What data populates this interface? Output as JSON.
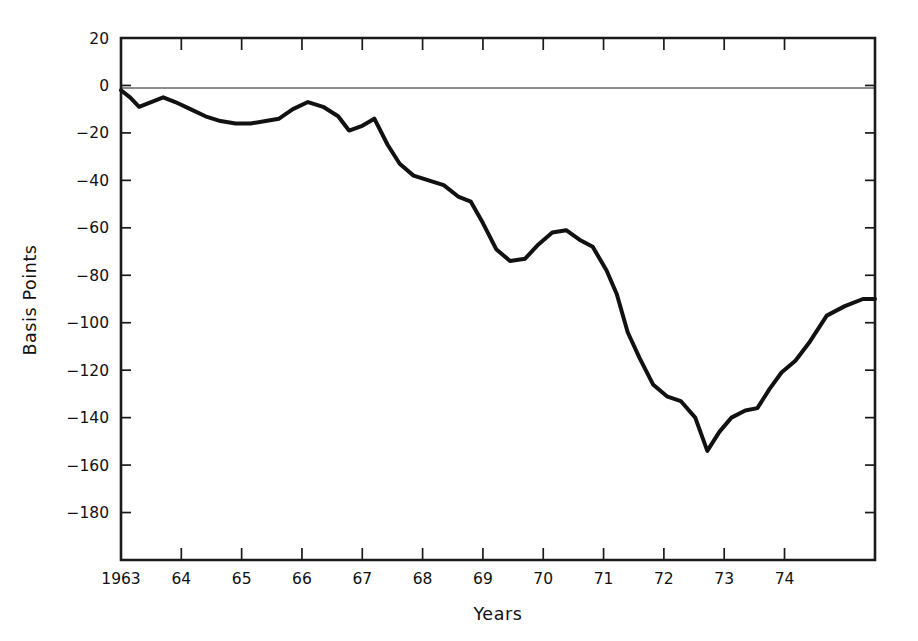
{
  "chart_data": {
    "type": "line",
    "title": "",
    "xlabel": "Years",
    "ylabel": "Basis Points",
    "xlim": [
      1963.0,
      1975.5
    ],
    "ylim": [
      -200,
      20
    ],
    "grid": false,
    "legend": false,
    "zero_reference_line": 0,
    "y_ticks": [
      20,
      0,
      -20,
      -40,
      -60,
      -80,
      -100,
      -120,
      -140,
      -160,
      -180
    ],
    "y_tick_labels": [
      "20",
      "0",
      "−20",
      "−40",
      "−60",
      "−80",
      "−100",
      "−120",
      "−140",
      "−160",
      "−180"
    ],
    "x_ticks": [
      1963,
      1964,
      1965,
      1966,
      1967,
      1968,
      1969,
      1970,
      1971,
      1972,
      1973,
      1974
    ],
    "x_tick_labels": [
      "1963",
      "64",
      "65",
      "66",
      "67",
      "68",
      "69",
      "70",
      "71",
      "72",
      "73",
      "74"
    ],
    "series": [
      {
        "name": "Basis point spread",
        "color": "#111111",
        "x": [
          1963.0,
          1963.15,
          1963.3,
          1963.5,
          1963.7,
          1963.9,
          1964.15,
          1964.4,
          1964.65,
          1964.9,
          1965.15,
          1965.4,
          1965.62,
          1965.85,
          1966.1,
          1966.35,
          1966.6,
          1966.78,
          1967.0,
          1967.2,
          1967.42,
          1967.62,
          1967.85,
          1968.1,
          1968.35,
          1968.6,
          1968.8,
          1969.0,
          1969.22,
          1969.45,
          1969.7,
          1969.92,
          1970.15,
          1970.38,
          1970.6,
          1970.82,
          1971.05,
          1971.22,
          1971.4,
          1971.6,
          1971.82,
          1972.05,
          1972.28,
          1972.52,
          1972.72,
          1972.92,
          1973.12,
          1973.35,
          1973.55,
          1973.75,
          1973.95,
          1974.18,
          1974.42,
          1974.7,
          1975.0,
          1975.3,
          1975.5
        ],
        "y": [
          -2,
          -5,
          -9,
          -7,
          -5,
          -7,
          -10,
          -13,
          -15,
          -16,
          -16,
          -15,
          -14,
          -10,
          -7,
          -9,
          -13,
          -19,
          -17,
          -14,
          -25,
          -33,
          -38,
          -40,
          -42,
          -47,
          -49,
          -58,
          -69,
          -74,
          -73,
          -67,
          -62,
          -61,
          -65,
          -68,
          -78,
          -88,
          -104,
          -115,
          -126,
          -131,
          -133,
          -140,
          -154,
          -146,
          -140,
          -137,
          -136,
          -128,
          -121,
          -116,
          -108,
          -97,
          -93,
          -90,
          -90
        ]
      }
    ],
    "annotations": {
      "minimum_value": -154,
      "minimum_x": 1971.4,
      "start_value": -2,
      "end_value": -67
    }
  },
  "axes": {
    "y_title": "Basis Points",
    "x_title": "Years"
  }
}
